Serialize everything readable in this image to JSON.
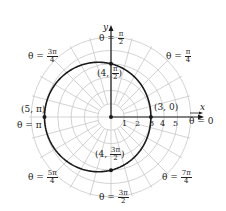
{
  "figure": {
    "center": [
      111,
      117
    ],
    "unit_px": 13.3,
    "grid_max_r": 6,
    "grid_angle_step_deg": 15,
    "colors": {
      "grid": "#c8c8c8",
      "curve": "#1a1a1a",
      "axis": "#1a1a1a",
      "text": "#222222"
    }
  },
  "axes": {
    "x_label": "x",
    "y_label": "y",
    "r_ticks": [
      "1",
      "2",
      "3",
      "4",
      "5"
    ]
  },
  "angle_labels": [
    {
      "id": "theta-0",
      "prefix": "θ = ",
      "value": "0"
    },
    {
      "id": "theta-pi-4",
      "prefix": "θ = ",
      "num": "π",
      "den": "4"
    },
    {
      "id": "theta-pi-2",
      "prefix": "θ = ",
      "num": "π",
      "den": "2"
    },
    {
      "id": "theta-3pi-4",
      "prefix": "θ = ",
      "num": "3π",
      "den": "4"
    },
    {
      "id": "theta-pi",
      "prefix": "θ = ",
      "value": "π"
    },
    {
      "id": "theta-5pi-4",
      "prefix": "θ = ",
      "num": "5π",
      "den": "4"
    },
    {
      "id": "theta-3pi-2",
      "prefix": "θ = ",
      "num": "3π",
      "den": "2"
    },
    {
      "id": "theta-7pi-4",
      "prefix": "θ = ",
      "num": "7π",
      "den": "4"
    }
  ],
  "points": [
    {
      "id": "p-3-0",
      "label": "(3, 0)",
      "r": 3,
      "theta_deg": 0
    },
    {
      "id": "p-4-pi2",
      "label_r": "4",
      "num": "π",
      "den": "2",
      "r": 4,
      "theta_deg": 90
    },
    {
      "id": "p-5-pi",
      "label": "(5, π)",
      "r": 5,
      "theta_deg": 180
    },
    {
      "id": "p-4-3pi2",
      "label_r": "4",
      "num": "3π",
      "den": "2",
      "r": 4,
      "theta_deg": 270
    }
  ],
  "chart_data": {
    "type": "polar",
    "title": "",
    "curve": "r = 4 − cos θ (limaçon)",
    "samples": [
      {
        "theta": "0",
        "r": 3
      },
      {
        "theta": "π/2",
        "r": 4
      },
      {
        "theta": "π",
        "r": 5
      },
      {
        "theta": "3π/2",
        "r": 4
      }
    ],
    "r_ticks": [
      1,
      2,
      3,
      4,
      5
    ],
    "r_range": [
      0,
      6
    ],
    "angle_labels": [
      "0",
      "π/4",
      "π/2",
      "3π/4",
      "π",
      "5π/4",
      "3π/2",
      "7π/4"
    ],
    "grid": true,
    "xlabel": "x",
    "ylabel": "y"
  }
}
